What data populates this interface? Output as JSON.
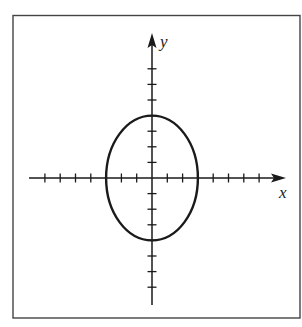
{
  "figure": {
    "type": "coordinate-plane-ellipse",
    "frame": {
      "x": 13,
      "y": 15,
      "width": 287,
      "height": 303,
      "stroke": "#444444"
    },
    "origin_px": {
      "x": 152,
      "y": 178
    },
    "unit_px": {
      "x": 15.3,
      "y": 15.6
    },
    "ink_color": "#1a1a1a"
  },
  "axes": {
    "x": {
      "label": "x",
      "start_px": 29,
      "end_px": 286,
      "ticks_each_side": 7,
      "arrow": "right"
    },
    "y": {
      "label": "y",
      "start_px": 305,
      "end_px": 33,
      "ticks_each_side": 7,
      "arrow": "up"
    }
  },
  "ellipse": {
    "center": [
      0,
      0
    ],
    "semi_axis_x": 3,
    "semi_axis_y": 4,
    "equation": "x^2/9 + y^2/16 = 1"
  },
  "chart_data": {
    "type": "line",
    "title": "",
    "xlabel": "x",
    "ylabel": "y",
    "xlim": [
      -8,
      8.5
    ],
    "ylim": [
      -8,
      9.5
    ],
    "grid": false,
    "x_ticks": [
      -7,
      -6,
      -5,
      -4,
      -3,
      -2,
      -1,
      1,
      2,
      3,
      4,
      5,
      6,
      7
    ],
    "y_ticks": [
      -7,
      -6,
      -5,
      -4,
      -3,
      -2,
      -1,
      1,
      2,
      3,
      4,
      5,
      6,
      7
    ],
    "tick_labels_shown": false,
    "series": [
      {
        "name": "ellipse",
        "shape": "ellipse",
        "center": [
          0,
          0
        ],
        "rx": 3,
        "ry": 4,
        "key_points": [
          [
            3,
            0
          ],
          [
            0,
            4
          ],
          [
            -3,
            0
          ],
          [
            0,
            -4
          ]
        ]
      }
    ]
  }
}
